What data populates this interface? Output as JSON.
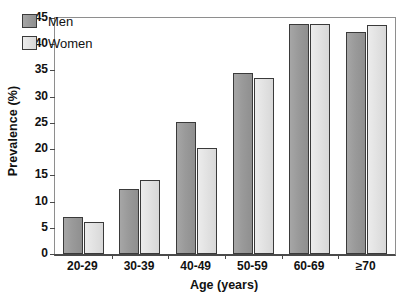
{
  "chart_data": {
    "type": "bar",
    "title": "",
    "subtitle": "",
    "xlabel": "Age (years)",
    "ylabel": "Prevalence (%)",
    "categories": [
      "20-29",
      "30-39",
      "40-49",
      "50-59",
      "60-69",
      "≥70"
    ],
    "series": [
      {
        "name": "Men",
        "color": "#9a9a9a",
        "values": [
          7.0,
          12.4,
          25.2,
          34.6,
          43.8,
          42.4
        ]
      },
      {
        "name": "Women",
        "color": "#e2e2e2",
        "values": [
          6.2,
          14.2,
          20.3,
          33.5,
          43.8,
          43.7
        ]
      }
    ],
    "ylim": [
      0,
      45
    ],
    "yticks": [
      0,
      5,
      10,
      15,
      20,
      25,
      30,
      35,
      40,
      45
    ],
    "ytick_labels": [
      "0",
      "5",
      "10",
      "15",
      "20",
      "25",
      "30",
      "35",
      "40",
      "45"
    ],
    "grid": false,
    "legend_position": "top-left",
    "legend_entries": [
      "Men",
      "Women"
    ]
  }
}
